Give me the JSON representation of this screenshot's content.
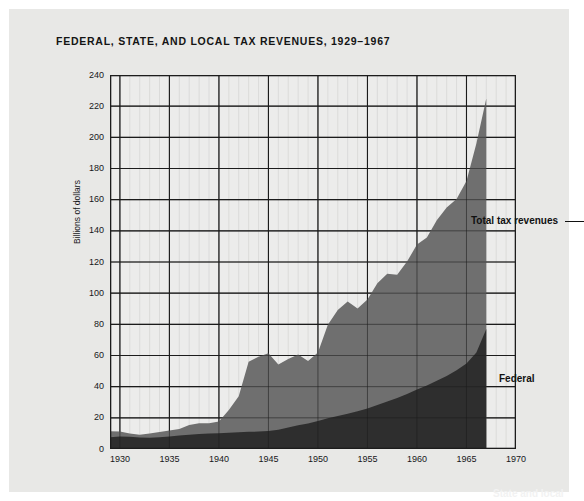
{
  "figure": {
    "title": "FEDERAL, STATE, AND LOCAL TAX REVENUES, 1929–1967"
  },
  "annotations": {
    "total": "Total tax revenues",
    "federal": "Federal",
    "state_local": "State and local"
  },
  "colors": {
    "page_background": "#e8e8e6",
    "plot_background": "#ececeb",
    "federal_band": "#6f6f6f",
    "state_local_band": "#2e2e2e",
    "gridline": "#1c1c1c",
    "text": "#17171a"
  },
  "chart_data": {
    "type": "area",
    "stacked": true,
    "title": "FEDERAL, STATE, AND LOCAL TAX REVENUES, 1929–1967",
    "xlabel": "",
    "ylabel": "Billions of dollars",
    "xlim": [
      1929,
      1970
    ],
    "ylim": [
      0,
      240
    ],
    "grid": true,
    "legend_position": "inline-annotations",
    "xticks": [
      1930,
      1935,
      1940,
      1945,
      1950,
      1955,
      1960,
      1965,
      1970
    ],
    "yticks": [
      0,
      20,
      40,
      60,
      80,
      100,
      120,
      140,
      160,
      180,
      200,
      220,
      240
    ],
    "x": [
      1929,
      1930,
      1931,
      1932,
      1933,
      1934,
      1935,
      1936,
      1937,
      1938,
      1939,
      1940,
      1941,
      1942,
      1943,
      1944,
      1945,
      1946,
      1947,
      1948,
      1949,
      1950,
      1951,
      1952,
      1953,
      1954,
      1955,
      1956,
      1957,
      1958,
      1959,
      1960,
      1961,
      1962,
      1963,
      1964,
      1965,
      1966,
      1967
    ],
    "series": [
      {
        "name": "State and local",
        "values": [
          7.6,
          8.0,
          7.8,
          7.3,
          7.2,
          7.6,
          8.1,
          8.6,
          9.2,
          9.6,
          9.9,
          10.1,
          10.5,
          10.8,
          11.0,
          11.2,
          11.5,
          12.3,
          13.8,
          15.2,
          16.4,
          18.0,
          19.7,
          21.2,
          22.7,
          24.2,
          26.0,
          28.3,
          30.5,
          32.8,
          35.3,
          38.2,
          40.8,
          43.8,
          46.9,
          50.5,
          54.9,
          62.0,
          77.0
        ]
      },
      {
        "name": "Federal",
        "values": [
          3.8,
          3.3,
          2.2,
          1.9,
          2.7,
          3.3,
          3.8,
          4.2,
          6.2,
          7.0,
          6.6,
          7.6,
          14.5,
          23.0,
          45.0,
          48.0,
          50.0,
          42.0,
          44.0,
          45.5,
          40.0,
          44.0,
          60.0,
          68.0,
          72.0,
          66.0,
          70.0,
          78.0,
          82.0,
          79.0,
          85.0,
          93.0,
          95.0,
          103.0,
          108.0,
          110.0,
          117.0,
          134.0,
          148.0
        ]
      }
    ],
    "total": [
      11.4,
      11.3,
      10.0,
      9.2,
      9.9,
      10.9,
      11.9,
      12.8,
      15.4,
      16.6,
      16.5,
      17.7,
      25.0,
      33.8,
      56.0,
      59.2,
      61.5,
      54.3,
      57.8,
      60.7,
      56.4,
      62.0,
      79.7,
      89.2,
      94.7,
      90.2,
      96.0,
      106.3,
      112.5,
      111.8,
      120.3,
      131.2,
      135.8,
      146.8,
      154.9,
      160.5,
      171.9,
      196.0,
      225.0
    ]
  }
}
